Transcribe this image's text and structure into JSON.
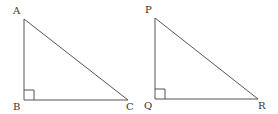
{
  "diagram": {
    "stroke_color": "#555555",
    "triangles": [
      {
        "name": "ABC",
        "right_angle_at": "B",
        "vertices": {
          "A": {
            "label": "A",
            "x": 24,
            "y": 19,
            "lx": 13,
            "ly": 14
          },
          "B": {
            "label": "B",
            "x": 24,
            "y": 100,
            "lx": 13,
            "ly": 110
          },
          "C": {
            "label": "C",
            "x": 128,
            "y": 100,
            "lx": 126,
            "ly": 110
          }
        }
      },
      {
        "name": "PQR",
        "right_angle_at": "Q",
        "vertices": {
          "P": {
            "label": "P",
            "x": 155,
            "y": 18,
            "lx": 145,
            "ly": 13
          },
          "Q": {
            "label": "Q",
            "x": 155,
            "y": 99,
            "lx": 144,
            "ly": 109
          },
          "R": {
            "label": "R",
            "x": 258,
            "y": 99,
            "lx": 258,
            "ly": 109
          }
        }
      }
    ]
  }
}
